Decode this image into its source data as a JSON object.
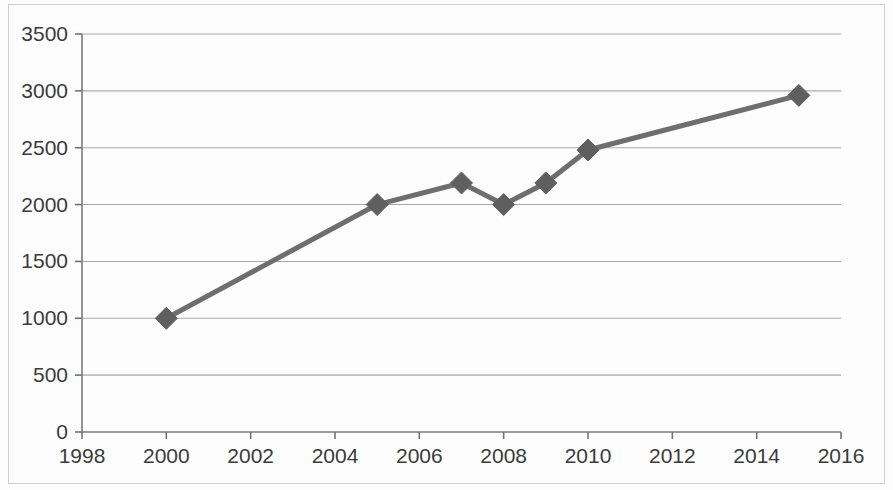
{
  "chart_data": {
    "type": "line",
    "title": "",
    "subtitle": "",
    "xlabel": "",
    "ylabel": "",
    "x": [
      2000,
      2005,
      2007,
      2008,
      2009,
      2010,
      2015
    ],
    "values": [
      1000,
      2000,
      2190,
      2000,
      2190,
      2480,
      2960
    ],
    "series": [
      {
        "name": "",
        "x": [
          2000,
          2005,
          2007,
          2008,
          2009,
          2010,
          2015
        ],
        "values": [
          1000,
          2000,
          2190,
          2000,
          2190,
          2480,
          2960
        ]
      }
    ],
    "xlim": [
      1998,
      2016
    ],
    "ylim": [
      0,
      3500
    ],
    "x_ticks": [
      1998,
      2000,
      2002,
      2004,
      2006,
      2008,
      2010,
      2012,
      2014,
      2016
    ],
    "x_tick_labels": [
      "1998",
      "2000",
      "2002",
      "2004",
      "2006",
      "2008",
      "2010",
      "2012",
      "2014",
      "2016"
    ],
    "y_ticks": [
      0,
      500,
      1000,
      1500,
      2000,
      2500,
      3000,
      3500
    ],
    "y_tick_labels": [
      "0",
      "500",
      "1000",
      "1500",
      "2000",
      "2500",
      "3000",
      "3500"
    ],
    "grid": {
      "horizontal": true,
      "vertical": false
    },
    "legend": {
      "visible": false,
      "position": "none",
      "entries": []
    },
    "annotations": [],
    "marker": "diamond",
    "colors": {
      "line": "#6e6e6e",
      "marker": "#5f5f5f",
      "grid": "#a8a8a8",
      "axis": "#6b6b6b",
      "tick_text": "#3b3b3b",
      "background": "#fdfdfd",
      "frame": "#cfcfcf"
    }
  }
}
